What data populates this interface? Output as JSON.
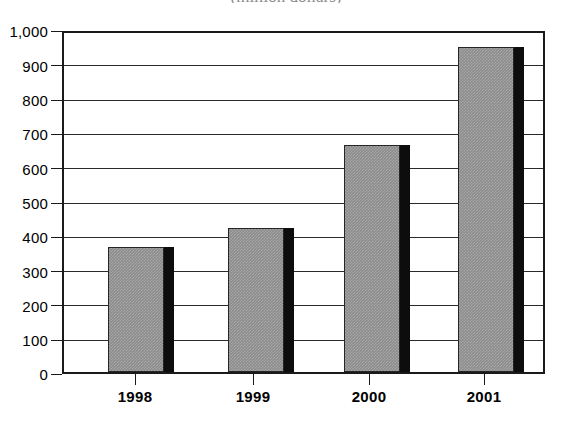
{
  "chart_data": {
    "type": "bar",
    "title": "(million dollars)",
    "xlabel": "",
    "ylabel": "",
    "categories": [
      "1998",
      "1999",
      "2000",
      "2001"
    ],
    "values": [
      370,
      425,
      670,
      958
    ],
    "series": [
      {
        "name": "Amount",
        "values": [
          370,
          425,
          670,
          958
        ]
      }
    ],
    "ylim": [
      0,
      1000
    ],
    "y_ticks": [
      0,
      100,
      200,
      300,
      400,
      500,
      600,
      700,
      800,
      900,
      1000
    ],
    "y_tick_labels": [
      "0",
      "100",
      "200",
      "300",
      "400",
      "500",
      "600",
      "700",
      "800",
      "900",
      "1,000"
    ],
    "grid": true,
    "legend": "none",
    "style": {
      "bar_face_color": "#8c8c8c",
      "bar_side_color": "#0d0d0d",
      "axis_color": "#1a1a1a",
      "grid_color": "#2a2a2a",
      "background_color": "#ffffff"
    }
  }
}
